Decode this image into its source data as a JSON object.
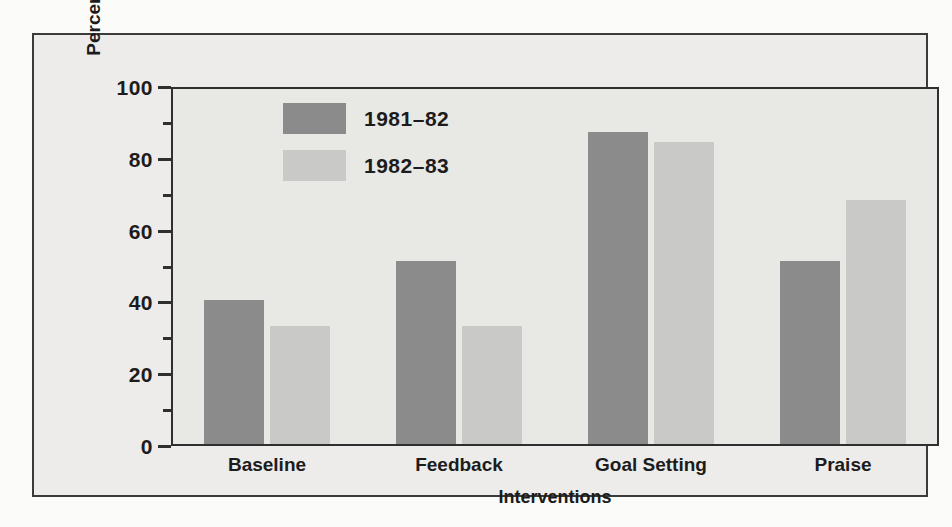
{
  "chart_data": {
    "type": "bar",
    "title": "",
    "xlabel": "Interventions",
    "ylabel": "Percentage of Games Won",
    "categories": [
      "Baseline",
      "Feedback",
      "Goal Setting",
      "Praise"
    ],
    "series": [
      {
        "name": "1981–82",
        "color": "#8b8b8b",
        "values": [
          40,
          51,
          87,
          51
        ]
      },
      {
        "name": "1982–83",
        "color": "#c9c9c7",
        "values": [
          33,
          33,
          84,
          68
        ]
      }
    ],
    "ylim": [
      0,
      100
    ],
    "ytick_major": [
      0,
      20,
      40,
      60,
      80,
      100
    ],
    "ytick_minor": [
      10,
      30,
      50,
      70,
      90
    ],
    "ytick_labels": [
      "0",
      "20",
      "40",
      "60",
      "80",
      "100"
    ],
    "grid": false,
    "legend_position": "upper-left-inside",
    "plot_background": "#e8e8e5",
    "figure_background": "#edecea",
    "axis_color": "#2f2f2f"
  },
  "legend": {
    "entries": [
      {
        "label": "1981–82"
      },
      {
        "label": "1982–83"
      }
    ]
  }
}
